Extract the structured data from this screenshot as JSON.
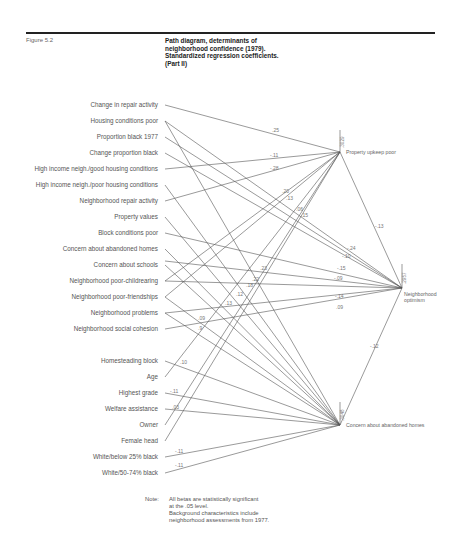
{
  "figure": {
    "label": "Figure 5.2",
    "title_lines": [
      "Path diagram, determinants of",
      "neighborhood confidence (1979).",
      "Standardized regression coefficients.",
      "(Part II)"
    ]
  },
  "variables": [
    "Change in repair activity",
    "Housing conditions poor",
    "Proportion black 1977",
    "Change proportion black",
    "High income neigh./good housing conditions",
    "High income neigh./poor housing conditions",
    "Neighborhood repair activity",
    "Property values",
    "Block conditions poor",
    "Concern about abandoned homes",
    "Concern about schools",
    "Neighborhood poor-childrearing",
    "Neighborhood poor-friendships",
    "Neighborhood problems",
    "Neighborhood social cohesion",
    "Homesteading block",
    "Age",
    "Highest grade",
    "Welfare assistance",
    "Owner",
    "Female head",
    "White/below 25% black",
    "White/50-74% black"
  ],
  "nodes": {
    "property_upkeep": {
      "label": "Property upkeep poor",
      "r2": ".3029"
    },
    "optimism": {
      "label_lines": [
        "Neighborhood",
        "optimism"
      ],
      "r2": ".2957"
    },
    "abandoned": {
      "label": "Concern about abandoned homes",
      "r2": ".3048"
    }
  },
  "coefficients": {
    "change_repair_to_upkeep": ".25",
    "hi_good_to_upkeep": "-.11",
    "repair_activity_to_upkeep": "-.28",
    "upkeep_in_a": ".20",
    "upkeep_in_b": ".13",
    "upkeep_in_c": ".06",
    "upkeep_in_d": ".15",
    "upkeep_to_optimism": "-.13",
    "to_optimism_a": "-.24",
    "to_optimism_b": "-.10",
    "concern_schools_to_optimism": "-.15",
    "childrearing_to_optimism": "-.09",
    "problems_to_optimism": "-.14",
    "cohesion_to_optimism": ".09",
    "abandoned_to_optimism": "-.12",
    "abandoned_in_a": ".23",
    "abandoned_in_b": ".22",
    "abandoned_in_c": ".18",
    "abandoned_in_d": ".12",
    "abandoned_in_e": ".13",
    "friendships_to_abandoned": ".09",
    "problems_to_abandoned": ".9",
    "homesteading_to_abandoned": ".10",
    "grade_to_abandoned": "-.11",
    "welfare_to_abandoned": ".03",
    "white25_to_abandoned": "-.11",
    "white50_to_abandoned": "-.11"
  },
  "note": {
    "label": "Note:",
    "lines": [
      "All betas are statistically significant",
      "at the .05 level.",
      "Background characteristics include",
      "neighborhood assessments from 1977."
    ]
  },
  "colors": {
    "line": "#555555",
    "text": "#555555",
    "title": "#222222"
  }
}
